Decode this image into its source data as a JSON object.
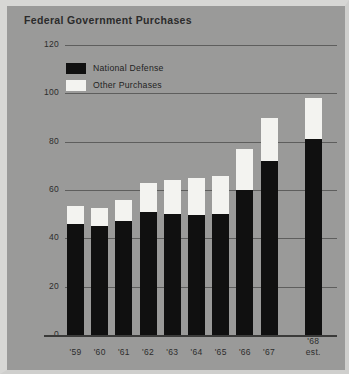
{
  "figure": {
    "title": "Federal Government Purchases",
    "panel_color": "#9a9a99",
    "frame_color": "#d7d7d5"
  },
  "legend": {
    "items": [
      {
        "label": "National Defense",
        "color": "#101010",
        "swatch": "defense"
      },
      {
        "label": "Other Purchases",
        "color": "#f3f3f0",
        "swatch": "other"
      }
    ]
  },
  "axes": {
    "ylabel": "$ Billions",
    "yticks": [
      0,
      20,
      40,
      60,
      80,
      100,
      120
    ],
    "ytick_labels": [
      "0",
      "20",
      "40",
      "60",
      "80",
      "100",
      "120"
    ],
    "xtick_labels": [
      "'59",
      "'60",
      "'61",
      "'62",
      "'63",
      "'64",
      "'65",
      "'66",
      "'67",
      "'68"
    ],
    "xtick_sublabels": [
      "",
      "",
      "",
      "",
      "",
      "",
      "",
      "",
      "",
      "est."
    ]
  },
  "chart_data": {
    "type": "bar",
    "title": "Federal Government Purchases",
    "xlabel": "",
    "ylabel": "$ Billions",
    "ylim": [
      0,
      120
    ],
    "grid": true,
    "stacked": true,
    "legend_position": "upper-left",
    "categories": [
      "'59",
      "'60",
      "'61",
      "'62",
      "'63",
      "'64",
      "'65",
      "'66",
      "'67",
      "'68 est."
    ],
    "series": [
      {
        "name": "National Defense",
        "color": "#101010",
        "values": [
          46,
          45,
          47,
          51,
          50,
          49.5,
          50,
          60,
          72,
          81
        ]
      },
      {
        "name": "Other Purchases",
        "color": "#f3f3f0",
        "values": [
          7.5,
          7.5,
          9,
          12,
          14,
          15.5,
          16,
          17,
          18,
          17
        ]
      }
    ],
    "totals": [
      53.5,
      52.5,
      56,
      63,
      64,
      65,
      66,
      77,
      90,
      98
    ]
  }
}
